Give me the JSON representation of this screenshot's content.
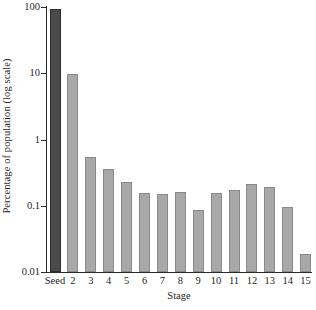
{
  "chart_data": {
    "type": "bar",
    "title": "",
    "xlabel": "Stage",
    "ylabel": "Percentage of population (log scale)",
    "yscale": "log",
    "ylim": [
      0.01,
      100
    ],
    "ytick_labels": [
      "100",
      "10",
      "1",
      "0.1",
      "0.01"
    ],
    "ytick_values": [
      100,
      10,
      1,
      0.1,
      0.01
    ],
    "grid": false,
    "legend": false,
    "categories": [
      "Seed",
      "2",
      "3",
      "4",
      "5",
      "6",
      "7",
      "8",
      "9",
      "10",
      "11",
      "12",
      "13",
      "14",
      "15"
    ],
    "values": [
      93,
      9.6,
      0.54,
      0.36,
      0.23,
      0.155,
      0.15,
      0.16,
      0.085,
      0.155,
      0.175,
      0.215,
      0.19,
      0.097,
      0.019
    ],
    "bar_colors": [
      "#4a4a4a",
      "#a8a8a8",
      "#a8a8a8",
      "#a8a8a8",
      "#a8a8a8",
      "#a8a8a8",
      "#a8a8a8",
      "#a8a8a8",
      "#a8a8a8",
      "#a8a8a8",
      "#a8a8a8",
      "#a8a8a8",
      "#a8a8a8",
      "#a8a8a8",
      "#a8a8a8"
    ],
    "bar_edge_colors": [
      "#2e2e2e",
      "#8a8a8a",
      "#8a8a8a",
      "#8a8a8a",
      "#8a8a8a",
      "#8a8a8a",
      "#8a8a8a",
      "#8a8a8a",
      "#8a8a8a",
      "#8a8a8a",
      "#8a8a8a",
      "#8a8a8a",
      "#8a8a8a",
      "#8a8a8a",
      "#8a8a8a"
    ],
    "highlight_category": "Seed",
    "axis_color": "#2b2b2b",
    "background_color": "#ffffff"
  },
  "layout": {
    "plot_left": 46,
    "plot_top": 7,
    "plot_width": 265,
    "plot_height": 265,
    "bar_width": 11,
    "first_bar_center": 55,
    "bar_pitch": 17.9
  }
}
